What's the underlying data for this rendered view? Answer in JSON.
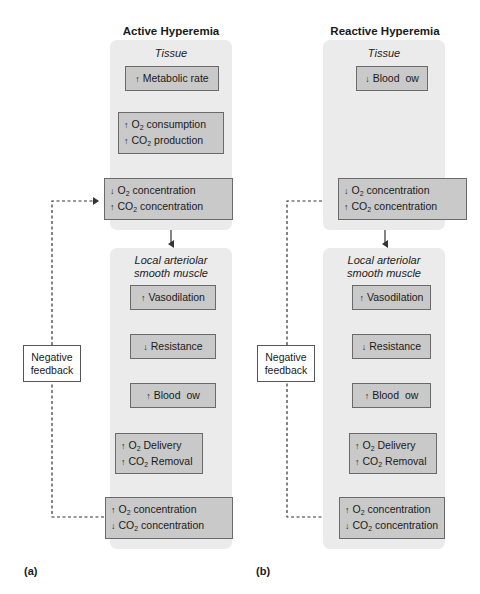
{
  "panels": [
    {
      "id": "a",
      "panel_label": "(a)",
      "title": "Active Hyperemia",
      "tissue_label": "Tissue",
      "muscle_label_line1": "Local arteriolar",
      "muscle_label_line2": "smooth muscle",
      "feedback_line1": "Negative",
      "feedback_line2": "feedback",
      "tissue_nodes": [
        {
          "lines": [
            {
              "dir": "↑",
              "pre": "Metabolic rate",
              "sub": "",
              "post": ""
            }
          ]
        },
        {
          "lines": [
            {
              "dir": "↑",
              "pre": "O",
              "sub": "2",
              "post": " consumption"
            },
            {
              "dir": "↑",
              "pre": "CO",
              "sub": "2",
              "post": " production"
            }
          ]
        },
        {
          "lines": [
            {
              "dir": "↓",
              "pre": "O",
              "sub": "2",
              "post": " concentration"
            },
            {
              "dir": "↑",
              "pre": "CO",
              "sub": "2",
              "post": " concentration"
            }
          ]
        }
      ],
      "muscle_nodes": [
        {
          "lines": [
            {
              "dir": "↑",
              "pre": "Vasodilation",
              "sub": "",
              "post": ""
            }
          ]
        },
        {
          "lines": [
            {
              "dir": "↓",
              "pre": "Resistance",
              "sub": "",
              "post": ""
            }
          ]
        },
        {
          "lines": [
            {
              "dir": "↑",
              "pre": "Blood  ow",
              "sub": "",
              "post": ""
            }
          ]
        },
        {
          "lines": [
            {
              "dir": "↑",
              "pre": "O",
              "sub": "2",
              "post": " Delivery"
            },
            {
              "dir": "↑",
              "pre": "CO",
              "sub": "2",
              "post": " Removal"
            }
          ]
        },
        {
          "lines": [
            {
              "dir": "↑",
              "pre": "O",
              "sub": "2",
              "post": " concentration"
            },
            {
              "dir": "↓",
              "pre": "CO",
              "sub": "2",
              "post": " concentration"
            }
          ]
        }
      ]
    },
    {
      "id": "b",
      "panel_label": "(b)",
      "title": "Reactive Hyperemia",
      "tissue_label": "Tissue",
      "muscle_label_line1": "Local arteriolar",
      "muscle_label_line2": "smooth muscle",
      "feedback_line1": "Negative",
      "feedback_line2": "feedback",
      "tissue_nodes": [
        {
          "lines": [
            {
              "dir": "↓",
              "pre": "Blood  ow",
              "sub": "",
              "post": ""
            }
          ]
        },
        {
          "lines": [
            {
              "dir": "↓",
              "pre": "O",
              "sub": "2",
              "post": " concentration"
            },
            {
              "dir": "↑",
              "pre": "CO",
              "sub": "2",
              "post": " concentration"
            }
          ]
        }
      ],
      "muscle_nodes": [
        {
          "lines": [
            {
              "dir": "↑",
              "pre": "Vasodilation",
              "sub": "",
              "post": ""
            }
          ]
        },
        {
          "lines": [
            {
              "dir": "↓",
              "pre": "Resistance",
              "sub": "",
              "post": ""
            }
          ]
        },
        {
          "lines": [
            {
              "dir": "↑",
              "pre": "Blood  ow",
              "sub": "",
              "post": ""
            }
          ]
        },
        {
          "lines": [
            {
              "dir": "↑",
              "pre": "O",
              "sub": "2",
              "post": " Delivery"
            },
            {
              "dir": "↑",
              "pre": "CO",
              "sub": "2",
              "post": " Removal"
            }
          ]
        },
        {
          "lines": [
            {
              "dir": "↑",
              "pre": "O",
              "sub": "2",
              "post": " concentration"
            },
            {
              "dir": "↓",
              "pre": "CO",
              "sub": "2",
              "post": " concentration"
            }
          ]
        }
      ]
    }
  ],
  "colors": {
    "region_bg": "#ebebeb",
    "node_bg": "#c9c9c9",
    "node_border": "#6a6a6a",
    "line": "#333333"
  }
}
